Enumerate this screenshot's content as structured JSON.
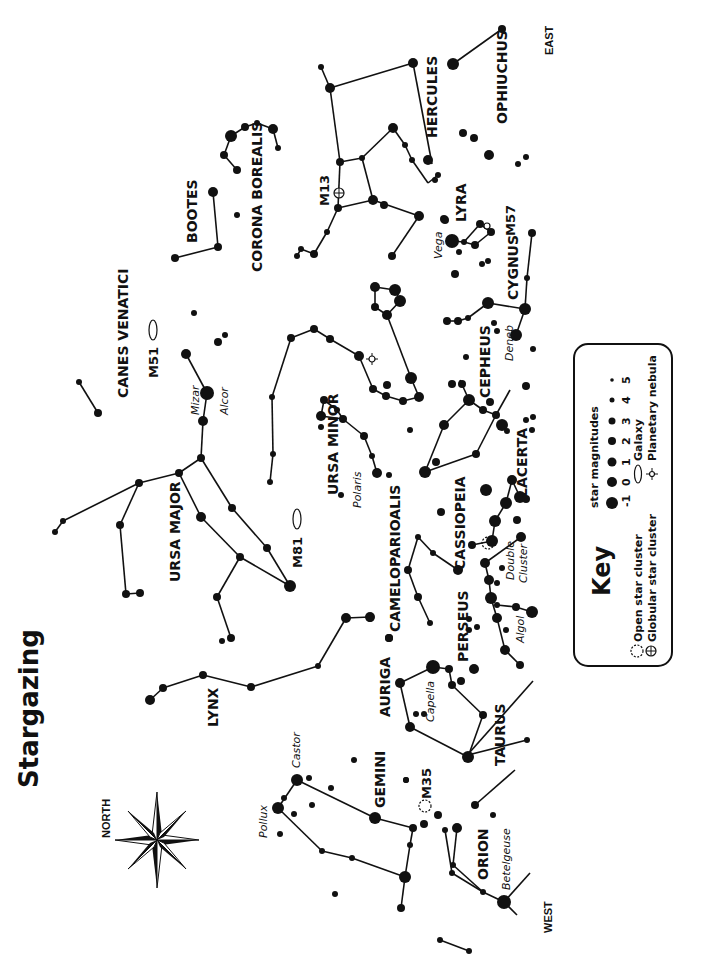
{
  "title": "Stargazing",
  "directions": {
    "north": "NORTH",
    "south_label_west": "WEST",
    "east": "EAST"
  },
  "constellations": [
    {
      "name": "GEMINI"
    },
    {
      "name": "ORION"
    },
    {
      "name": "TAURUS"
    },
    {
      "name": "AURIGA"
    },
    {
      "name": "PERSEUS"
    },
    {
      "name": "LYNX"
    },
    {
      "name": "CAMELOPARIOALIS"
    },
    {
      "name": "CASSIOPEIA"
    },
    {
      "name": "LACERTA"
    },
    {
      "name": "CEPHEUS"
    },
    {
      "name": "CYGNUS"
    },
    {
      "name": "LYRA"
    },
    {
      "name": "HERCULES"
    },
    {
      "name": "OPHIUCHUS"
    },
    {
      "name": "CORONA BOREALIS"
    },
    {
      "name": "BOOTES"
    },
    {
      "name": "CANES VENATICI"
    },
    {
      "name": "URSA MAJOR"
    },
    {
      "name": "URSA MINOR"
    }
  ],
  "stars": {
    "pollux": "Pollux",
    "castor": "Castor",
    "betelgeuse": "Betelgeuse",
    "capella": "Capella",
    "algol": "Algol",
    "double_cluster_1": "Double",
    "double_cluster_2": "Cluster",
    "polaris": "Polaris",
    "deneb": "Deneb",
    "vega": "Vega",
    "mizar": "Mizar",
    "alcor": "Alcor"
  },
  "objects": {
    "m35": "M35",
    "m81": "M81",
    "m51": "M51",
    "m13": "M13",
    "m57": "M57"
  },
  "key": {
    "title": "Key",
    "magnitudes_title": "star magnitudes",
    "magnitudes": [
      "-1",
      "0",
      "1",
      "2",
      "3",
      "4",
      "5"
    ],
    "open_cluster": "Open star cluster",
    "globular_cluster": "Globular star cluster",
    "galaxy": "Galaxy",
    "planetary_nebula": "Planetary nebula"
  }
}
